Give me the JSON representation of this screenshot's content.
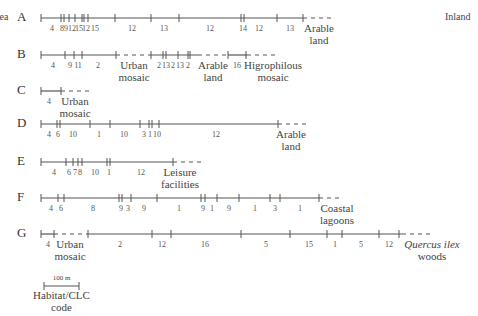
{
  "side_labels": {
    "left": "Sea",
    "right": "Inland"
  },
  "colors": {
    "line": "#555555",
    "text": "#333333"
  },
  "transects": [
    {
      "id": "A",
      "y": 18,
      "segments": [
        {
          "x1": 41,
          "x2": 303,
          "style": "solid"
        },
        {
          "x1": 303,
          "x2": 335,
          "style": "dashed"
        }
      ],
      "ticks": [
        41,
        61,
        64,
        69,
        75,
        82,
        84,
        88,
        115,
        151,
        179,
        241,
        244,
        277,
        303
      ],
      "numbers": [
        {
          "x": 52,
          "t": "4"
        },
        {
          "x": 62,
          "t": "8"
        },
        {
          "x": 66,
          "t": "9"
        },
        {
          "x": 72,
          "t": "12"
        },
        {
          "x": 79,
          "t": "15"
        },
        {
          "x": 86,
          "t": "12"
        },
        {
          "x": 95,
          "t": "15"
        },
        {
          "x": 132,
          "t": "12"
        },
        {
          "x": 164,
          "t": "13"
        },
        {
          "x": 210,
          "t": "12"
        },
        {
          "x": 243,
          "t": "14"
        },
        {
          "x": 259,
          "t": "12"
        },
        {
          "x": 290,
          "t": "13"
        }
      ],
      "end_labels": [
        {
          "x": 319,
          "lines": [
            "Arable",
            "land"
          ]
        }
      ]
    },
    {
      "id": "B",
      "y": 55,
      "segments": [
        {
          "x1": 41,
          "x2": 116,
          "style": "solid"
        },
        {
          "x1": 116,
          "x2": 151,
          "style": "dashed"
        },
        {
          "x1": 151,
          "x2": 198,
          "style": "solid"
        },
        {
          "x1": 198,
          "x2": 228,
          "style": "dashed"
        },
        {
          "x1": 228,
          "x2": 247,
          "style": "solid"
        },
        {
          "x1": 247,
          "x2": 278,
          "style": "dashed"
        }
      ],
      "ticks": [
        41,
        65,
        74,
        82,
        116,
        151,
        163,
        166,
        178,
        188,
        190,
        228,
        246
      ],
      "numbers": [
        {
          "x": 53,
          "t": "4"
        },
        {
          "x": 70,
          "t": "9"
        },
        {
          "x": 78,
          "t": "11"
        },
        {
          "x": 98,
          "t": "2"
        },
        {
          "x": 159,
          "t": "2"
        },
        {
          "x": 166,
          "t": "13"
        },
        {
          "x": 173,
          "t": "2"
        },
        {
          "x": 180,
          "t": "13"
        },
        {
          "x": 188,
          "t": "2"
        },
        {
          "x": 237,
          "t": "16"
        }
      ],
      "end_labels": [
        {
          "x": 134,
          "lines": [
            "Urban",
            "mosaic"
          ]
        },
        {
          "x": 213,
          "lines": [
            "Arable",
            "land"
          ]
        },
        {
          "x": 273,
          "lines": [
            "Higrophilous",
            "mosaic"
          ]
        }
      ]
    },
    {
      "id": "C",
      "y": 91,
      "segments": [
        {
          "x1": 41,
          "x2": 61,
          "style": "solid"
        },
        {
          "x1": 61,
          "x2": 92,
          "style": "dashed"
        }
      ],
      "ticks": [
        41,
        61
      ],
      "numbers": [
        {
          "x": 49,
          "t": "4"
        }
      ],
      "end_labels": [
        {
          "x": 75,
          "lines": [
            "Urban",
            "mosaic"
          ]
        }
      ]
    },
    {
      "id": "D",
      "y": 124,
      "segments": [
        {
          "x1": 41,
          "x2": 278,
          "style": "solid"
        },
        {
          "x1": 278,
          "x2": 310,
          "style": "dashed"
        }
      ],
      "ticks": [
        41,
        57,
        60,
        90,
        110,
        140,
        149,
        152,
        159,
        278
      ],
      "numbers": [
        {
          "x": 49,
          "t": "4"
        },
        {
          "x": 58,
          "t": "6"
        },
        {
          "x": 73,
          "t": "10"
        },
        {
          "x": 99,
          "t": "1"
        },
        {
          "x": 124,
          "t": "10"
        },
        {
          "x": 144,
          "t": "3"
        },
        {
          "x": 150,
          "t": "1"
        },
        {
          "x": 157,
          "t": "10"
        },
        {
          "x": 216,
          "t": "12"
        }
      ],
      "end_labels": [
        {
          "x": 291,
          "lines": [
            "Arable",
            "land"
          ]
        }
      ]
    },
    {
      "id": "E",
      "y": 162,
      "segments": [
        {
          "x1": 41,
          "x2": 173,
          "style": "solid"
        },
        {
          "x1": 173,
          "x2": 204,
          "style": "dashed"
        }
      ],
      "ticks": [
        41,
        66,
        73,
        78,
        82,
        107,
        110,
        173
      ],
      "numbers": [
        {
          "x": 54,
          "t": "4"
        },
        {
          "x": 69,
          "t": "6"
        },
        {
          "x": 75,
          "t": "7"
        },
        {
          "x": 80,
          "t": "8"
        },
        {
          "x": 95,
          "t": "10"
        },
        {
          "x": 109,
          "t": "1"
        },
        {
          "x": 141,
          "t": "12"
        }
      ],
      "end_labels": [
        {
          "x": 180,
          "lines": [
            "Leisure",
            "facilities"
          ]
        }
      ]
    },
    {
      "id": "F",
      "y": 198,
      "segments": [
        {
          "x1": 41,
          "x2": 319,
          "style": "solid"
        },
        {
          "x1": 319,
          "x2": 340,
          "style": "dashed"
        }
      ],
      "ticks": [
        41,
        58,
        64,
        119,
        122,
        131,
        157,
        201,
        205,
        217,
        239,
        270,
        280,
        319
      ],
      "numbers": [
        {
          "x": 51,
          "t": "4"
        },
        {
          "x": 61,
          "t": "6"
        },
        {
          "x": 93,
          "t": "8"
        },
        {
          "x": 121,
          "t": "9"
        },
        {
          "x": 128,
          "t": "3"
        },
        {
          "x": 144,
          "t": "9"
        },
        {
          "x": 179,
          "t": "1"
        },
        {
          "x": 203,
          "t": "9"
        },
        {
          "x": 212,
          "t": "1"
        },
        {
          "x": 229,
          "t": "9"
        },
        {
          "x": 255,
          "t": "1"
        },
        {
          "x": 275,
          "t": "3"
        },
        {
          "x": 300,
          "t": "1"
        }
      ],
      "end_labels": [
        {
          "x": 337,
          "lines": [
            "Coastal",
            "lagoons"
          ]
        }
      ]
    },
    {
      "id": "G",
      "y": 234,
      "segments": [
        {
          "x1": 41,
          "x2": 54,
          "style": "solid"
        },
        {
          "x1": 54,
          "x2": 88,
          "style": "dashed"
        },
        {
          "x1": 88,
          "x2": 402,
          "style": "solid"
        },
        {
          "x1": 402,
          "x2": 430,
          "style": "dashed"
        }
      ],
      "ticks": [
        41,
        54,
        88,
        152,
        171,
        241,
        290,
        327,
        342,
        379,
        399
      ],
      "numbers": [
        {
          "x": 48,
          "t": "4"
        },
        {
          "x": 120,
          "t": "2"
        },
        {
          "x": 162,
          "t": "12"
        },
        {
          "x": 205,
          "t": "16"
        },
        {
          "x": 266,
          "t": "5"
        },
        {
          "x": 309,
          "t": "15"
        },
        {
          "x": 335,
          "t": "1"
        },
        {
          "x": 361,
          "t": "5"
        },
        {
          "x": 389,
          "t": "12"
        }
      ],
      "end_labels": [
        {
          "x": 70,
          "lines": [
            "Urban",
            "mosaic"
          ]
        },
        {
          "x": 432,
          "lines": [
            "Quercus ilex",
            "woods"
          ],
          "italic_first": true
        }
      ]
    }
  ],
  "legend": {
    "scale_text": "100 m",
    "x1": 44,
    "x2": 79,
    "y": 286,
    "label_lines": [
      "Habitat/CLC",
      "code"
    ]
  }
}
